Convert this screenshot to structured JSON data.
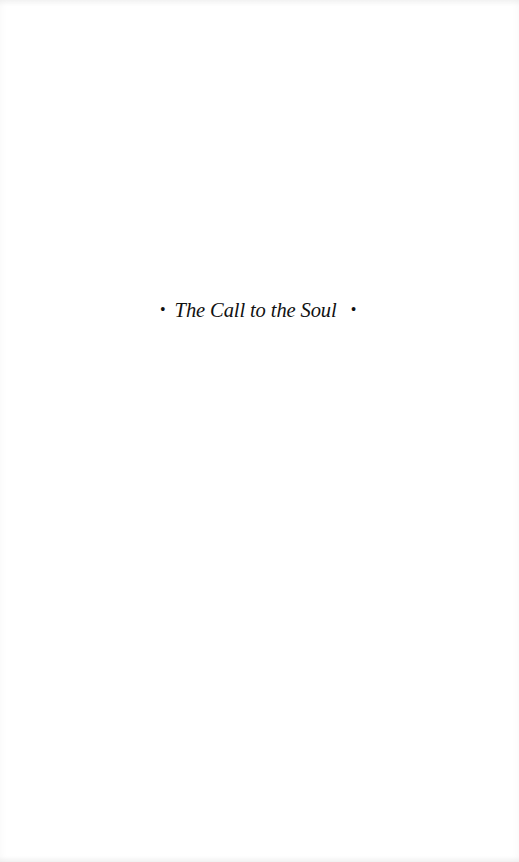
{
  "page": {
    "type": "half-title",
    "title": "The Call to the Soul",
    "ornament_left": "•",
    "ornament_right": "•"
  }
}
